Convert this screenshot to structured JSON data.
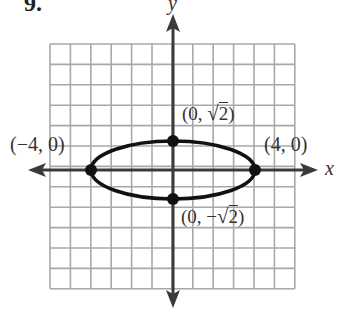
{
  "problem_number": "9.",
  "axes": {
    "x_label": "x",
    "y_label": "y"
  },
  "grid": {
    "x_range": [
      -6,
      6
    ],
    "y_range": [
      -6,
      6
    ],
    "cell_units": 1
  },
  "curve": {
    "type": "ellipse",
    "equation": "x^2/16 + y^2/2 = 1",
    "a": 4,
    "b": 1.4142
  },
  "points": [
    {
      "label": "(−4, 0)",
      "x": -4,
      "y": 0
    },
    {
      "label": "(4, 0)",
      "x": 4,
      "y": 0
    },
    {
      "label_prefix": "(0, ",
      "label_root": "2",
      "label_suffix": ")",
      "x": 0,
      "y": 1.4142
    },
    {
      "label_prefix": "(0, −",
      "label_root": "2",
      "label_suffix": ")",
      "x": 0,
      "y": -1.4142
    }
  ],
  "colors": {
    "grid": "#a8a8a8",
    "axis": "#3a3a3a",
    "curve": "#111111",
    "text": "#333333"
  }
}
